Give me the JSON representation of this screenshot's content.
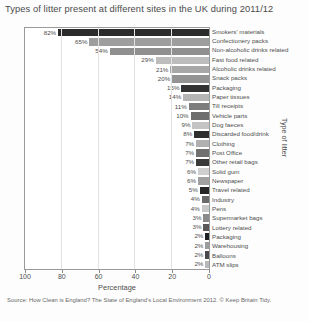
{
  "title": "Types of litter present at different sites in the UK during 2011/12",
  "source": "Source: How Clean is England? The State of England's Local Environment 2012. © Keep Britain Tidy.",
  "axis": {
    "xlabel": "Percentage",
    "ylabel": "Type of litter",
    "xticks": [
      "100",
      "80",
      "60",
      "40",
      "20",
      "0"
    ]
  },
  "chart_data": {
    "type": "bar",
    "title": "Types of litter present at different sites in the UK during 2011/12",
    "xlabel": "Percentage",
    "ylabel": "Type of litter",
    "orientation": "horizontal",
    "x_axis_reversed": true,
    "xlim": [
      100,
      0
    ],
    "grid": true,
    "legend": false,
    "categories": [
      "Smokers' materials",
      "Confectionery packs",
      "Non-alcoholic drinks related",
      "Fast food related",
      "Alcoholic drinks related",
      "Snack packs",
      "Packaging",
      "Paper tissues",
      "Till receipts",
      "Vehicle parts",
      "Dog faeces",
      "Discarded food/drink",
      "Clothing",
      "Post Office",
      "Other retail bags",
      "Solid gum",
      "Newspaper",
      "Travel related",
      "Industry",
      "Pens",
      "Supermarket bags",
      "Lottery related",
      "Packaging",
      "Warehousing",
      "Balloons",
      "ATM slips"
    ],
    "values": [
      82,
      65,
      54,
      29,
      21,
      20,
      15,
      14,
      11,
      10,
      9,
      8,
      7,
      7,
      7,
      6,
      6,
      5,
      4,
      4,
      3,
      3,
      2,
      2,
      2,
      2
    ],
    "value_labels": [
      "82%",
      "65%",
      "54%",
      "29%",
      "21%",
      "20%",
      "15%",
      "14%",
      "11%",
      "10%",
      "9%",
      "8%",
      "7%",
      "7%",
      "7%",
      "6%",
      "6%",
      "5%",
      "4%",
      "4%",
      "3%",
      "3%",
      "2%",
      "2%",
      "2%",
      "2%"
    ],
    "bar_colors": [
      "#2b2b2b",
      "#9e9e9e",
      "#8f8f8f",
      "#bdbdbd",
      "#a8a8a8",
      "#949494",
      "#333333",
      "#b5b5b5",
      "#7d7d7d",
      "#6e6e6e",
      "#c4c4c4",
      "#2e2e2e",
      "#b0b0b0",
      "#707070",
      "#3a3a3a",
      "#cfcfcf",
      "#a0a0a0",
      "#262626",
      "#6a6a6a",
      "#c8c8c8",
      "#8a8a8a",
      "#585858",
      "#1f1f1f",
      "#9c9c9c",
      "#4a4a4a",
      "#b8b8b8"
    ]
  }
}
